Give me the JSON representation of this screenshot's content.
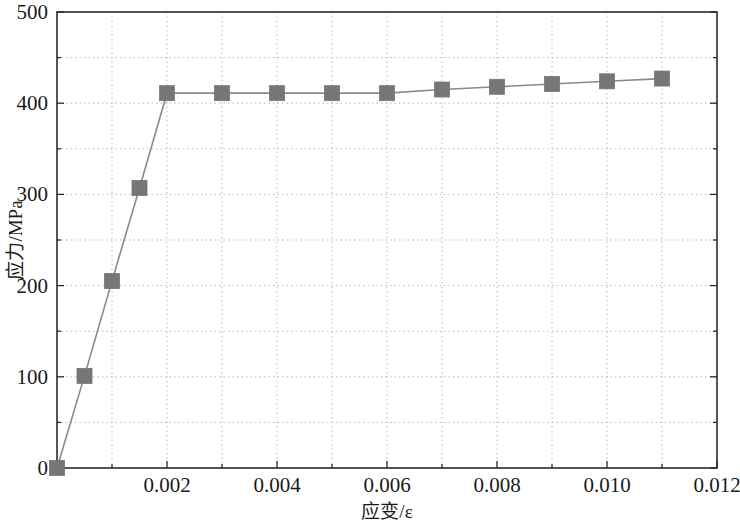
{
  "chart_data": {
    "type": "line",
    "title": "",
    "subtitle": "",
    "xlabel": "应变/ε",
    "ylabel": "应力/MPa",
    "xlim": [
      0,
      0.012
    ],
    "ylim": [
      0,
      500
    ],
    "xticks": [
      0,
      0.002,
      0.004,
      0.006,
      0.008,
      0.01,
      0.012
    ],
    "xtick_labels": [
      "",
      "0.002",
      "0.004",
      "0.006",
      "0.008",
      "0.010",
      "0.012"
    ],
    "yticks": [
      0,
      100,
      200,
      300,
      400,
      500
    ],
    "ytick_labels": [
      "0",
      "100",
      "200",
      "300",
      "400",
      "500"
    ],
    "x_minor_tick_count": 1,
    "y_minor_tick_count": 1,
    "grid": true,
    "grid_style": "dotted",
    "grid_color": "#b9b9b9",
    "legend": null,
    "legend_position": "none",
    "series": [
      {
        "name": "stress-strain",
        "marker": "square",
        "marker_color": "#767676",
        "line_color": "#8a8a8a",
        "x": [
          0,
          0.0005,
          0.001,
          0.0015,
          0.002,
          0.003,
          0.004,
          0.005,
          0.006,
          0.007,
          0.008,
          0.009,
          0.01,
          0.011
        ],
        "y": [
          0,
          101,
          205,
          307,
          411,
          411,
          411,
          411,
          411,
          415,
          418,
          421,
          424,
          427
        ]
      }
    ],
    "annotations": []
  },
  "figure": {
    "background_color": "#ffffff",
    "axis_color": "#2b2b2b"
  }
}
